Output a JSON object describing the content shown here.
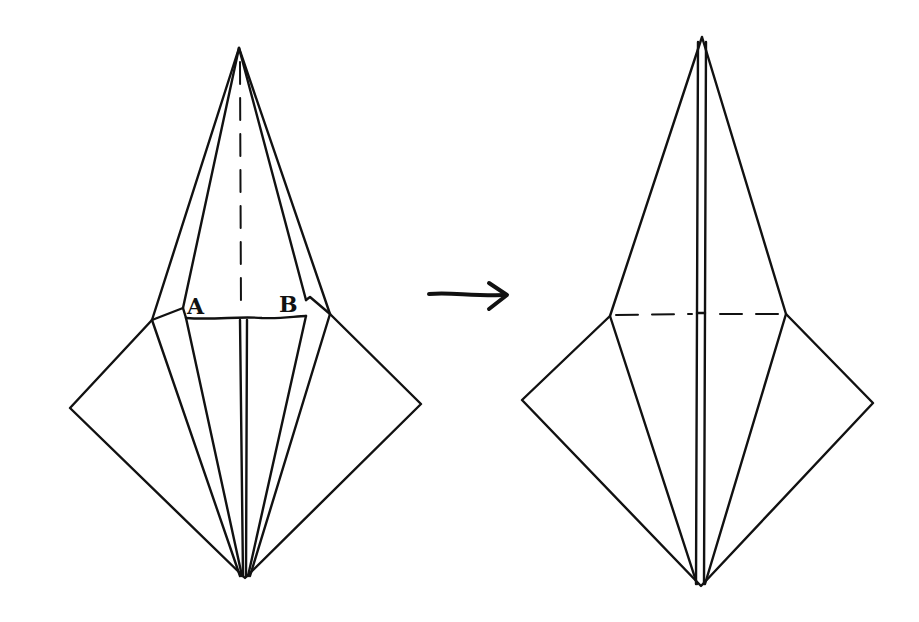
{
  "diagram": {
    "type": "origami-folding-step",
    "background": "#ffffff",
    "ink_color": "#111111",
    "labels": {
      "point_a": "A",
      "point_b": "B"
    },
    "steps": [
      {
        "name": "before",
        "description": "Kite/crane base with narrow top point; inner flaps marked A and B; vertical valley fold (dashed) through top point"
      },
      {
        "name": "after",
        "description": "Resulting shape after fold; horizontal dashed fold line across the middle"
      }
    ],
    "arrow": "right-arrow"
  }
}
